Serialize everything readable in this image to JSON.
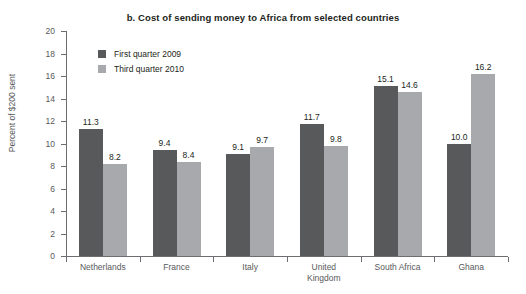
{
  "chart_data": {
    "type": "bar",
    "title": "b. Cost of sending money to Africa from selected countries",
    "xlabel": "",
    "ylabel": "Percent of $200 sent",
    "ylim": [
      0,
      20
    ],
    "ytick_step": 2,
    "yticks": [
      "20",
      "18",
      "16",
      "14",
      "12",
      "10",
      "8",
      "6",
      "4",
      "2",
      "0"
    ],
    "grid": false,
    "legend_position": "top-left-inside",
    "categories": [
      "Netherlands",
      "France",
      "Italy",
      "United Kingdom",
      "South Africa",
      "Ghana"
    ],
    "category_label_lines": [
      [
        "Netherlands"
      ],
      [
        "France"
      ],
      [
        "Italy"
      ],
      [
        "United",
        "Kingdom"
      ],
      [
        "South Africa"
      ],
      [
        "Ghana"
      ]
    ],
    "series": [
      {
        "name": "First quarter 2009",
        "color": "#58595b",
        "values": [
          11.3,
          9.4,
          9.1,
          11.7,
          15.1,
          10.0
        ],
        "labels": [
          "11.3",
          "9.4",
          "9.1",
          "11.7",
          "15.1",
          "10.0"
        ]
      },
      {
        "name": "Third quarter 2010",
        "color": "#a7a9ac",
        "values": [
          8.2,
          8.4,
          9.7,
          9.8,
          14.6,
          16.2
        ],
        "labels": [
          "8.2",
          "8.4",
          "9.7",
          "9.8",
          "14.6",
          "16.2"
        ]
      }
    ]
  },
  "colors": {
    "series_first_quarter": "#58595b",
    "series_third_quarter": "#a7a9ac",
    "axis": "#6d6e71",
    "text": "#231f20",
    "background": "#ffffff"
  }
}
